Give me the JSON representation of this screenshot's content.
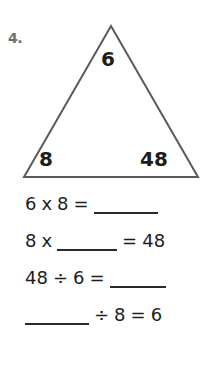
{
  "worksheet": {
    "problem_number": "4.",
    "number_color": "#6e6e6e",
    "ink_color": "#1d1d1d",
    "stroke_color": "#5a5a5a",
    "background": "#ffffff"
  },
  "triangle": {
    "name": "fact-family-triangle",
    "top_value": "6",
    "bottom_left_value": "8",
    "bottom_right_value": "48",
    "apex": {
      "x": 111,
      "y": 26
    },
    "bottom_left": {
      "x": 24,
      "y": 177
    },
    "bottom_right": {
      "x": 198,
      "y": 177
    }
  },
  "equations": [
    {
      "id": "equation-1",
      "tokens": [
        {
          "type": "text",
          "value": "6"
        },
        {
          "type": "text",
          "value": "x"
        },
        {
          "type": "text",
          "value": "8"
        },
        {
          "type": "text",
          "value": "="
        },
        {
          "type": "blank",
          "width": "long"
        }
      ],
      "plain": "6 x 8 = ______"
    },
    {
      "id": "equation-2",
      "tokens": [
        {
          "type": "text",
          "value": "8"
        },
        {
          "type": "text",
          "value": "x"
        },
        {
          "type": "blank",
          "width": "mid"
        },
        {
          "type": "text",
          "value": "="
        },
        {
          "type": "text",
          "value": "48"
        }
      ],
      "plain": "8 x _____ = 48"
    },
    {
      "id": "equation-3",
      "tokens": [
        {
          "type": "text",
          "value": "48"
        },
        {
          "type": "text",
          "value": "÷"
        },
        {
          "type": "text",
          "value": "6"
        },
        {
          "type": "text",
          "value": "="
        },
        {
          "type": "blank",
          "width": "short"
        }
      ],
      "plain": "48 ÷ 6 = _____"
    },
    {
      "id": "equation-4",
      "tokens": [
        {
          "type": "blank",
          "width": "long"
        },
        {
          "type": "text",
          "value": "÷"
        },
        {
          "type": "text",
          "value": "8"
        },
        {
          "type": "text",
          "value": "="
        },
        {
          "type": "text",
          "value": "6"
        }
      ],
      "plain": "______ ÷ 8 = 6"
    }
  ]
}
